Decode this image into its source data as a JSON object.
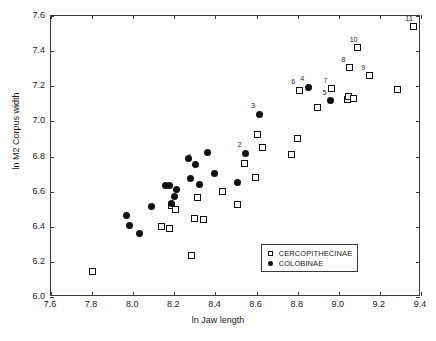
{
  "chart_data": {
    "type": "scatter",
    "title": "",
    "xlabel": "ln Jaw length",
    "ylabel": "ln M2 Corpus width",
    "xlim": [
      7.6,
      9.4
    ],
    "ylim": [
      6.0,
      7.6
    ],
    "xticks": [
      "7.6",
      "7.8",
      "8.0",
      "8.2",
      "8.4",
      "8.6",
      "8.8",
      "9.0",
      "9.2",
      "9.4"
    ],
    "yticks": [
      "6.0",
      "6.2",
      "6.4",
      "6.6",
      "6.8",
      "7.0",
      "7.2",
      "7.4",
      "7.6"
    ],
    "xtick_values": [
      7.6,
      7.8,
      8.0,
      8.2,
      8.4,
      8.6,
      8.8,
      9.0,
      9.2,
      9.4
    ],
    "ytick_values": [
      6.0,
      6.2,
      6.4,
      6.6,
      6.8,
      7.0,
      7.2,
      7.4,
      7.6
    ],
    "grid": false,
    "legend_position": "lower-right-inside",
    "series": [
      {
        "name": "CERCOPITHECINAE",
        "marker": "open-square",
        "color": "#111111",
        "points": [
          {
            "x": 7.8,
            "y": 6.148,
            "label": ""
          },
          {
            "x": 8.136,
            "y": 6.399,
            "label": ""
          },
          {
            "x": 8.176,
            "y": 6.391,
            "label": ""
          },
          {
            "x": 8.188,
            "y": 6.519,
            "label": ""
          },
          {
            "x": 8.204,
            "y": 6.501,
            "label": ""
          },
          {
            "x": 8.284,
            "y": 6.238,
            "label": ""
          },
          {
            "x": 8.296,
            "y": 6.446,
            "label": ""
          },
          {
            "x": 8.312,
            "y": 6.566,
            "label": ""
          },
          {
            "x": 8.344,
            "y": 6.44,
            "label": ""
          },
          {
            "x": 8.432,
            "y": 6.602,
            "label": ""
          },
          {
            "x": 8.508,
            "y": 6.527,
            "label": ""
          },
          {
            "x": 8.54,
            "y": 6.758,
            "label": ""
          },
          {
            "x": 8.596,
            "y": 6.683,
            "label": ""
          },
          {
            "x": 8.604,
            "y": 6.926,
            "label": ""
          },
          {
            "x": 8.628,
            "y": 6.852,
            "label": ""
          },
          {
            "x": 8.772,
            "y": 6.813,
            "label": ""
          },
          {
            "x": 8.8,
            "y": 6.904,
            "label": ""
          },
          {
            "x": 8.808,
            "y": 7.176,
            "label": "6"
          },
          {
            "x": 8.896,
            "y": 7.079,
            "label": ""
          },
          {
            "x": 8.964,
            "y": 7.187,
            "label": "7"
          },
          {
            "x": 9.04,
            "y": 7.124,
            "label": ""
          },
          {
            "x": 9.048,
            "y": 7.14,
            "label": ""
          },
          {
            "x": 9.052,
            "y": 7.305,
            "label": "8"
          },
          {
            "x": 9.072,
            "y": 7.131,
            "label": ""
          },
          {
            "x": 9.092,
            "y": 7.42,
            "label": "10"
          },
          {
            "x": 9.148,
            "y": 7.259,
            "label": "9"
          },
          {
            "x": 9.284,
            "y": 7.184,
            "label": ""
          },
          {
            "x": 9.364,
            "y": 7.538,
            "label": "11"
          }
        ]
      },
      {
        "name": "COLOBINAE",
        "marker": "filled-circle",
        "color": "#111111",
        "points": [
          {
            "x": 7.968,
            "y": 6.462,
            "label": ""
          },
          {
            "x": 7.984,
            "y": 6.409,
            "label": ""
          },
          {
            "x": 8.032,
            "y": 6.361,
            "label": ""
          },
          {
            "x": 8.088,
            "y": 6.516,
            "label": ""
          },
          {
            "x": 8.156,
            "y": 6.636,
            "label": ""
          },
          {
            "x": 8.176,
            "y": 6.636,
            "label": ""
          },
          {
            "x": 8.188,
            "y": 6.531,
            "label": ""
          },
          {
            "x": 8.2,
            "y": 6.57,
            "label": ""
          },
          {
            "x": 8.212,
            "y": 6.614,
            "label": ""
          },
          {
            "x": 8.268,
            "y": 6.788,
            "label": ""
          },
          {
            "x": 8.28,
            "y": 6.674,
            "label": ""
          },
          {
            "x": 8.304,
            "y": 6.752,
            "label": "1"
          },
          {
            "x": 8.324,
            "y": 6.639,
            "label": ""
          },
          {
            "x": 8.36,
            "y": 6.824,
            "label": ""
          },
          {
            "x": 8.396,
            "y": 6.701,
            "label": ""
          },
          {
            "x": 8.508,
            "y": 6.654,
            "label": ""
          },
          {
            "x": 8.548,
            "y": 6.819,
            "label": "2"
          },
          {
            "x": 8.612,
            "y": 7.041,
            "label": "3"
          },
          {
            "x": 8.852,
            "y": 7.193,
            "label": "4"
          },
          {
            "x": 8.96,
            "y": 7.117,
            "label": "5"
          }
        ]
      }
    ]
  },
  "legend": {
    "entries": [
      {
        "label": "CERCOPITHECINAE",
        "marker": "open-square"
      },
      {
        "label": "COLOBINAE",
        "marker": "filled-circle"
      }
    ]
  }
}
